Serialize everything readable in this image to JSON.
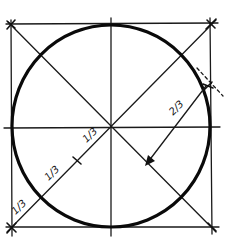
{
  "diagram": {
    "colors": {
      "ink": "#111111",
      "background": "#ffffff"
    },
    "square": {
      "x1": 11,
      "y1": 25,
      "x2": 211,
      "y2": 227
    },
    "circle": {
      "cx": 111,
      "cy": 126,
      "r": 100
    },
    "labels": {
      "radius_fraction": "2/3",
      "upper_third": "1/3",
      "middle_third": "1/3",
      "lower_third": "1/3"
    },
    "annotations": {
      "arrow": "arrow from circle edge to diagonal marking 2/3 distance",
      "ticks": "diagonal divided into thirds from lower-left corner to center"
    }
  }
}
